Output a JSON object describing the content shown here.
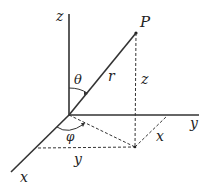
{
  "colors": {
    "axis": "#333333",
    "dashed": "#333333",
    "label": "#222222",
    "background": "#ffffff"
  },
  "labels": {
    "z_axis": "z",
    "y_axis": "y",
    "x_axis": "x",
    "point": "P",
    "radius": "r",
    "theta": "θ",
    "phi": "φ",
    "z_height": "z",
    "x_component": "x",
    "y_component": "y"
  },
  "geometry": {
    "origin": [
      69,
      115
    ],
    "z_axis_top": [
      69,
      14
    ],
    "y_axis_end": [
      199,
      115
    ],
    "x_axis_end": [
      11,
      172
    ],
    "point_P": [
      136,
      33
    ],
    "projection": [
      135,
      147
    ],
    "x_tick_on_y_axis": [
      167,
      116
    ],
    "y_tick_on_x_axis": [
      38,
      148
    ]
  }
}
